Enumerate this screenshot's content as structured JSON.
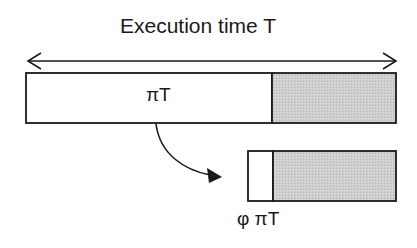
{
  "diagram": {
    "title": "Execution time T",
    "full_run": {
      "label": "πT",
      "completed_fraction_label": "πT",
      "remaining_shaded": true
    },
    "restart_run": {
      "label": "φ πT",
      "remaining_shaded": true
    },
    "colors": {
      "stroke": "#1a1a1a",
      "shaded_fill": "#c8c8c8",
      "background": "#ffffff"
    },
    "arrows": {
      "span_arrow": "double-headed arrow spanning execution time T",
      "transition_arrow": "curved arrow from end of first segment to restarted run"
    }
  }
}
